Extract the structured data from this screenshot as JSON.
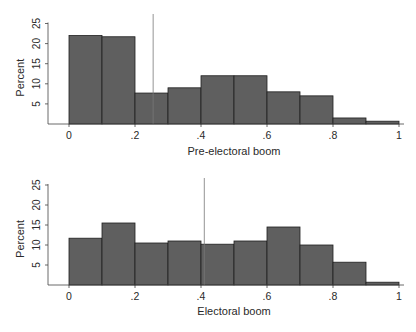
{
  "chart_data": [
    {
      "type": "bar",
      "subtype": "histogram",
      "title": "",
      "xlabel": "Pre-electoral boom",
      "ylabel": "Percent",
      "bin_edges": [
        0,
        0.1,
        0.2,
        0.3,
        0.4,
        0.5,
        0.6,
        0.7,
        0.8,
        0.9,
        1.0
      ],
      "values": [
        22,
        21.7,
        7.7,
        9,
        12,
        12,
        8,
        7,
        1.5,
        0.7
      ],
      "xticks": [
        "0",
        ".2",
        ".4",
        ".6",
        ".8",
        "1"
      ],
      "yticks": [
        "5",
        "10",
        "15",
        "20",
        "25"
      ],
      "xlim": [
        0,
        1
      ],
      "ylim": [
        0,
        25
      ],
      "reference_line_x": 0.255,
      "grid": false,
      "bar_color": "#5f5f5f"
    },
    {
      "type": "bar",
      "subtype": "histogram",
      "title": "",
      "xlabel": "Electoral boom",
      "ylabel": "Percent",
      "bin_edges": [
        0,
        0.1,
        0.2,
        0.3,
        0.4,
        0.5,
        0.6,
        0.7,
        0.8,
        0.9,
        1.0
      ],
      "values": [
        11.7,
        15.5,
        10.5,
        11,
        10.2,
        11,
        14.5,
        10,
        5.7,
        0.7
      ],
      "xticks": [
        "0",
        ".2",
        ".4",
        ".6",
        ".8",
        "1"
      ],
      "yticks": [
        "5",
        "10",
        "15",
        "20",
        "25"
      ],
      "xlim": [
        0,
        1
      ],
      "ylim": [
        0,
        25
      ],
      "reference_line_x": 0.41,
      "grid": false,
      "bar_color": "#5f5f5f"
    }
  ]
}
